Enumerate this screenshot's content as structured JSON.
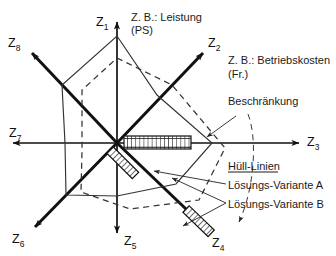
{
  "figure": {
    "type": "radar-star-diagram",
    "axes": [
      {
        "id": "z1",
        "label": "Z",
        "sub": "1",
        "angle_deg": 90,
        "tip": [
          117,
          17
        ],
        "label_pos": [
          96,
          22
        ]
      },
      {
        "id": "z2",
        "label": "Z",
        "sub": "2",
        "angle_deg": 45,
        "tip": [
          206,
          49
        ],
        "label_pos": [
          208,
          44
        ]
      },
      {
        "id": "z3",
        "label": "Z",
        "sub": "3",
        "angle_deg": 0,
        "tip": [
          303,
          143
        ],
        "label_pos": [
          307,
          146
        ]
      },
      {
        "id": "z4",
        "label": "Z",
        "sub": "4",
        "angle_deg": -45,
        "tip": [
          213,
          236
        ],
        "label_pos": [
          212,
          244
        ]
      },
      {
        "id": "z5",
        "label": "Z",
        "sub": "5",
        "angle_deg": -90,
        "tip": [
          117,
          238
        ],
        "label_pos": [
          124,
          244
        ]
      },
      {
        "id": "z6",
        "label": "Z",
        "sub": "6",
        "angle_deg": 225,
        "tip": [
          31,
          231
        ],
        "label_pos": [
          14,
          243
        ]
      },
      {
        "id": "z7",
        "label": "Z",
        "sub": "7",
        "angle_deg": 180,
        "tip": [
          8,
          143
        ],
        "label_pos": [
          11,
          134
        ]
      },
      {
        "id": "z8",
        "label": "Z",
        "sub": "8",
        "angle_deg": 135,
        "tip": [
          27,
          48
        ],
        "label_pos": [
          10,
          45
        ]
      }
    ],
    "origin": [
      117,
      143
    ],
    "annotations": [
      {
        "id": "leistung",
        "lines": [
          "Z. B.: Leistung",
          "(PS)"
        ],
        "pos": [
          131,
          21
        ]
      },
      {
        "id": "betriebskosten",
        "lines": [
          "Z. B.: Betriebskosten",
          "(Fr.)"
        ],
        "pos": [
          228,
          64
        ]
      },
      {
        "id": "beschraenkung",
        "lines": [
          "Beschränkung"
        ],
        "pos": [
          228,
          105
        ]
      },
      {
        "id": "huell-linien",
        "lines": [
          "Hüll-Linien"
        ],
        "pos": [
          228,
          167
        ]
      },
      {
        "id": "variante-a",
        "lines": [
          "Lösungs-Variante A"
        ],
        "pos": [
          228,
          187
        ]
      },
      {
        "id": "variante-b",
        "lines": [
          "Lösungs-Variante B"
        ],
        "pos": [
          228,
          206
        ]
      }
    ],
    "variant_a": {
      "name": "Lösungs-Variante A",
      "style": "solid",
      "vertices": [
        [
          117,
          36
        ],
        [
          157,
          95
        ],
        [
          212,
          143
        ],
        [
          176,
          184
        ],
        [
          117,
          196
        ],
        [
          66,
          195
        ],
        [
          65,
          143
        ],
        [
          62,
          85
        ]
      ]
    },
    "variant_b": {
      "name": "Lösungs-Variante B",
      "style": "dashed",
      "vertices": [
        [
          117,
          58
        ],
        [
          172,
          85
        ],
        [
          225,
          148
        ],
        [
          199,
          200
        ],
        [
          130,
          209
        ],
        [
          81,
          192
        ],
        [
          82,
          151
        ],
        [
          82,
          90
        ]
      ]
    },
    "constraint_bars": [
      {
        "id": "bar-z3",
        "axis": "z3",
        "from": [
          124,
          136
        ],
        "to": [
          191,
          136
        ],
        "thickness": 13,
        "pattern": "cross-hatch"
      },
      {
        "id": "bar-z6",
        "axis": "z6",
        "from": [
          110,
          150
        ],
        "to": [
          85,
          175
        ],
        "thickness": 9,
        "pattern": "diagonal-hatch"
      },
      {
        "id": "bar-z4",
        "axis": "z4",
        "from": [
          186,
          209
        ],
        "to": [
          211,
          233
        ],
        "thickness": 9,
        "pattern": "diagonal-hatch"
      }
    ],
    "colors": {
      "ink": "#1a1a1a",
      "axis": "#111111",
      "hull_a": "#333333",
      "hull_b": "#333333",
      "background": "#ffffff"
    }
  }
}
